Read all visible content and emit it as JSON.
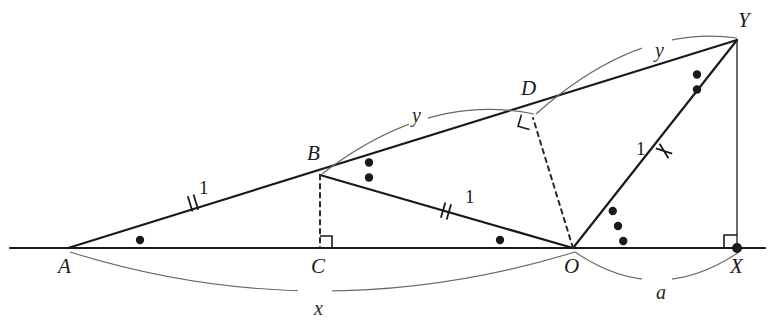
{
  "figure": {
    "type": "euclidean-geometry-diagram",
    "background": "#ffffff",
    "line_color": "#1a1a1a",
    "arc_color": "#6b6b55",
    "dash_color": "#2a2a2a",
    "width": 775,
    "height": 328
  },
  "points": [
    {
      "id": "A",
      "label": "A",
      "x": 68,
      "y": 248,
      "label_x": 58,
      "label_y": 256,
      "dot": false
    },
    {
      "id": "C",
      "label": "C",
      "x": 320,
      "y": 248,
      "label_x": 311,
      "label_y": 256,
      "dot": false
    },
    {
      "id": "O",
      "label": "O",
      "x": 573,
      "y": 248,
      "label_x": 564,
      "label_y": 256,
      "dot": false
    },
    {
      "id": "X",
      "label": "X",
      "x": 737,
      "y": 248,
      "label_x": 730,
      "label_y": 256,
      "dot": true
    },
    {
      "id": "B",
      "label": "B",
      "x": 320,
      "y": 175,
      "label_x": 307,
      "label_y": 143,
      "dot": false
    },
    {
      "id": "D",
      "label": "D",
      "x": 533,
      "y": 118,
      "label_x": 521,
      "label_y": 78,
      "dot": false
    },
    {
      "id": "Y",
      "label": "Y",
      "x": 737,
      "y": 40,
      "label_x": 738,
      "label_y": 10,
      "dot": false
    }
  ],
  "segments": [
    {
      "name": "baseline-A-X",
      "from": [
        10,
        248
      ],
      "to": [
        765,
        248
      ],
      "style": "solid",
      "width": 2.2
    },
    {
      "name": "ray-A-Y",
      "from": [
        68,
        248
      ],
      "to": [
        737,
        40
      ],
      "style": "solid",
      "width": 2.2
    },
    {
      "name": "segment-B-O",
      "from": [
        320,
        175
      ],
      "to": [
        573,
        248
      ],
      "style": "solid",
      "width": 2.2
    },
    {
      "name": "segment-O-Y",
      "from": [
        573,
        248
      ],
      "to": [
        737,
        40
      ],
      "style": "solid",
      "width": 2.2
    },
    {
      "name": "segment-Y-X",
      "from": [
        737,
        40
      ],
      "to": [
        737,
        248
      ],
      "style": "solid",
      "width": 1.3
    },
    {
      "name": "altitude-B-C",
      "from": [
        320,
        175
      ],
      "to": [
        320,
        248
      ],
      "style": "dashed",
      "width": 2.0
    },
    {
      "name": "altitude-O-D",
      "from": [
        573,
        248
      ],
      "to": [
        533,
        118
      ],
      "style": "dashed",
      "width": 2.0
    }
  ],
  "right_angles": [
    {
      "name": "right-angle-at-C",
      "vertex": [
        320,
        248
      ],
      "dir1": [
        0,
        -1
      ],
      "dir2": [
        1,
        0
      ],
      "size": 12
    },
    {
      "name": "right-angle-at-D",
      "vertex": [
        533,
        118
      ],
      "dir1": [
        -0.96,
        -0.28
      ],
      "dir2": [
        -0.29,
        0.96
      ],
      "size": 12
    },
    {
      "name": "right-angle-at-X",
      "vertex": [
        737,
        248
      ],
      "dir1": [
        0,
        -1
      ],
      "dir2": [
        -1,
        0
      ],
      "size": 13
    }
  ],
  "angle_dots": [
    {
      "name": "angle-dot-A",
      "vertex": "A",
      "count": 1,
      "cx": 140,
      "cy": 240,
      "dir": "horizontal"
    },
    {
      "name": "angle-dot-B",
      "vertex": "B",
      "count": 2,
      "cx": 369,
      "cy": 170,
      "dir": "vertical"
    },
    {
      "name": "angle-dot-O-BOA",
      "vertex": "O",
      "count": 1,
      "cx": 500,
      "cy": 240,
      "dir": "horizontal"
    },
    {
      "name": "angle-dot-O-YOX",
      "vertex": "O",
      "count": 3,
      "cx": 618,
      "cy": 226,
      "dir": "vertical"
    },
    {
      "name": "angle-dot-Y",
      "vertex": "Y",
      "count": 2,
      "cx": 697,
      "cy": 82,
      "dir": "vertical"
    }
  ],
  "tick_marks": [
    {
      "name": "tick-AB",
      "at": [
        193,
        203
      ],
      "angle": -17,
      "count": 2,
      "style": "parallel",
      "label": "1",
      "label_x": 199,
      "label_y": 178
    },
    {
      "name": "tick-BO",
      "at": [
        446,
        211
      ],
      "angle": 16,
      "count": 2,
      "style": "parallel",
      "label": "1",
      "label_x": 465,
      "label_y": 187
    },
    {
      "name": "tick-OY",
      "at": [
        664,
        151
      ],
      "angle": -52,
      "count": 2,
      "style": "cross",
      "label": "1",
      "label_x": 636,
      "label_y": 139
    }
  ],
  "arcs": [
    {
      "name": "arc-x-A-to-O",
      "label": "x",
      "label_x": 311,
      "label_y": 298,
      "path": "M 70 252 Q 320 330 575 252",
      "gap": {
        "x": 298,
        "y": 288,
        "w": 34,
        "h": 22
      }
    },
    {
      "name": "arc-a-O-to-X",
      "label": "a",
      "label_x": 653,
      "label_y": 282,
      "path": "M 575 252 Q 657 308 739 252",
      "gap": {
        "x": 642,
        "y": 272,
        "w": 30,
        "h": 22
      }
    },
    {
      "name": "arc-y-B-to-D",
      "label": "y",
      "label_x": 409,
      "label_y": 105,
      "path": "M 322 174 Q 428 92 534 114",
      "gap": {
        "x": 398,
        "y": 98,
        "w": 30,
        "h": 22
      }
    },
    {
      "name": "arc-y-D-to-Y",
      "label": "y",
      "label_x": 652,
      "label_y": 40,
      "path": "M 536 114 Q 637 24 737 38",
      "gap": {
        "x": 642,
        "y": 33,
        "w": 30,
        "h": 22
      }
    }
  ]
}
